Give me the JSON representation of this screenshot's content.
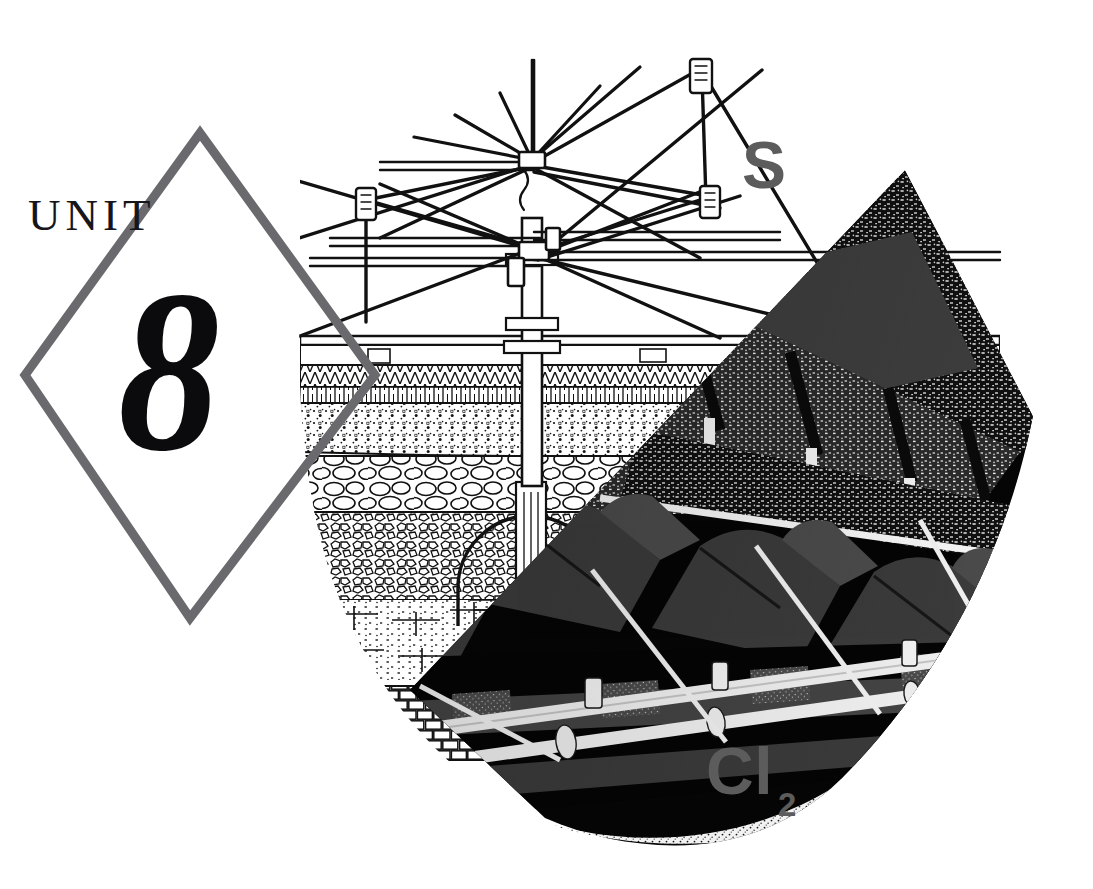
{
  "page": {
    "type": "textbook-unit-opener",
    "width": 1093,
    "height": 889,
    "background_color": "#ffffff"
  },
  "badge": {
    "shape": "diamond-outline",
    "stroke_color": "#6a6a6e",
    "unit_word": "UNIT",
    "unit_number": "8",
    "unit_word_color": "#16161a",
    "unit_number_color": "#0b0b0d"
  },
  "labels": {
    "sulfur": "S",
    "chlorine_symbol": "Cl",
    "chlorine_subscript": "2",
    "label_color": "#5c5c5c"
  },
  "illustration": {
    "title": "water-treatment-plant-cutaway",
    "description": "Cutaway of a trickling filter / water treatment plant: rotating distributor arm above a layered media bed, with a dark covered chlorine contact chamber at lower right",
    "line_color": "#141414",
    "dark_fill": "#050505",
    "mid_gray": "#4e4e4e",
    "parts": [
      "rotating-distributor-arm",
      "center-column",
      "guy-wires",
      "tensioner-turnbuckles",
      "wall-coping",
      "sand-gravel-layer",
      "cobble-layer",
      "crushed-rock-media",
      "underdrain-blocks",
      "stone-foundation-wall",
      "effluent-channel",
      "covered-tank-rows",
      "vent-pipes",
      "roof-trusses"
    ]
  }
}
